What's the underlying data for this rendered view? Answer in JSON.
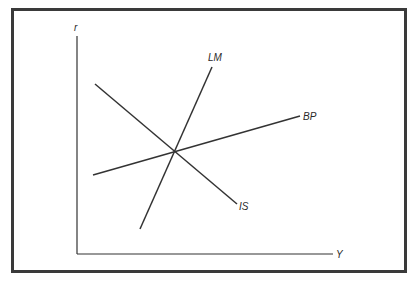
{
  "diagram": {
    "type": "IS-LM-BP macroeconomic diagram",
    "axes": {
      "y_label": "r",
      "x_label": "Y",
      "origin": [
        77,
        254
      ],
      "y_top": [
        77,
        36
      ],
      "x_right": [
        333,
        254
      ]
    },
    "curves": [
      {
        "name": "LM",
        "label": "LM",
        "from": [
          140,
          229
        ],
        "to": [
          212,
          67
        ],
        "label_pos": [
          208,
          61
        ]
      },
      {
        "name": "BP",
        "label": "BP",
        "from": [
          93,
          175
        ],
        "to": [
          300,
          116
        ],
        "label_pos": [
          303,
          121
        ]
      },
      {
        "name": "IS",
        "label": "IS",
        "from": [
          95,
          84
        ],
        "to": [
          237,
          204
        ],
        "label_pos": [
          239,
          211
        ]
      }
    ],
    "intersection": [
      175,
      152
    ],
    "colors": {
      "line": "#333333",
      "frame": "#3a3a3a",
      "text": "#2a2a2a",
      "background": "#ffffff"
    }
  }
}
